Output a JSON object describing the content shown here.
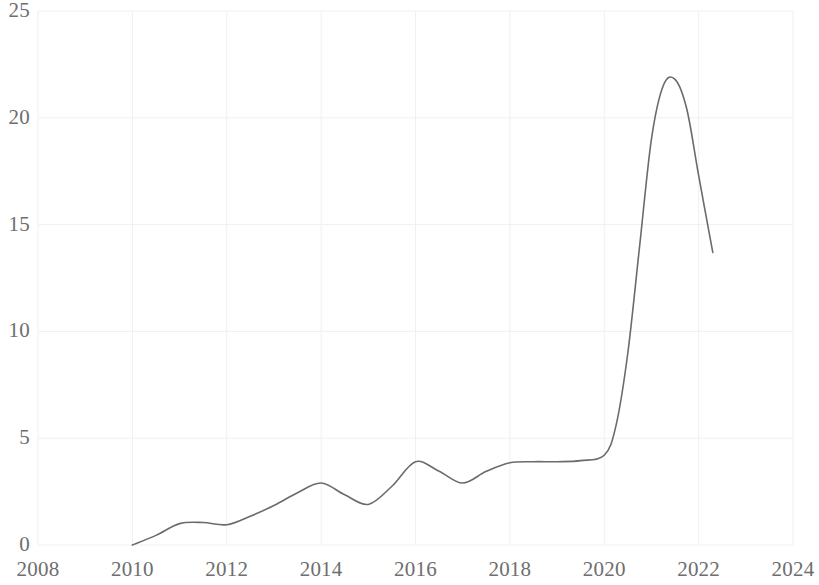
{
  "chart_data": {
    "type": "line",
    "title": "",
    "subtitle": "",
    "xlabel": "",
    "ylabel": "",
    "xlim": [
      2008,
      2024
    ],
    "ylim": [
      0,
      25
    ],
    "grid": true,
    "legend": null,
    "legend_position": "none",
    "x_ticks": [
      2008,
      2010,
      2012,
      2014,
      2016,
      2018,
      2020,
      2022,
      2024
    ],
    "x_tick_labels": [
      "2008",
      "2010",
      "2012",
      "2014",
      "2016",
      "2018",
      "2020",
      "2022",
      "2024"
    ],
    "y_ticks": [
      0,
      5,
      10,
      15,
      20,
      25
    ],
    "y_tick_labels": [
      "0",
      "5",
      "10",
      "15",
      "20",
      "25"
    ],
    "line_color": "#6b6b6b",
    "line_width": 1.6,
    "grid_color": "#f0f0f0",
    "series": [
      {
        "name": "series-1",
        "x": [
          2010.0,
          2010.5,
          2011.0,
          2011.5,
          2012.0,
          2012.5,
          2013.0,
          2013.5,
          2014.0,
          2014.5,
          2015.0,
          2015.5,
          2016.0,
          2016.5,
          2017.0,
          2017.5,
          2018.0,
          2018.5,
          2019.0,
          2019.5,
          2020.0,
          2020.25,
          2020.5,
          2020.75,
          2021.0,
          2021.25,
          2021.5,
          2021.75,
          2022.0,
          2022.3
        ],
        "values": [
          0.0,
          0.45,
          1.0,
          1.05,
          0.95,
          1.35,
          1.85,
          2.45,
          2.9,
          2.35,
          1.9,
          2.75,
          3.9,
          3.45,
          2.9,
          3.45,
          3.85,
          3.9,
          3.9,
          3.95,
          4.2,
          5.6,
          9.0,
          14.0,
          19.0,
          21.5,
          21.8,
          20.4,
          17.3,
          13.7
        ]
      }
    ],
    "annotations": []
  },
  "axes": {
    "y_axis_name": "value-axis",
    "x_axis_name": "year-axis"
  },
  "watermark": {
    "text": ""
  }
}
